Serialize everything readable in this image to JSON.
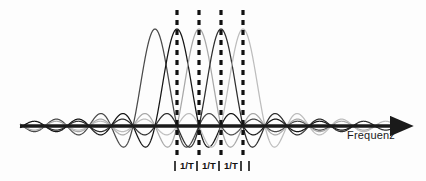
{
  "figure": {
    "background_color": "#fdfdfd"
  },
  "axis": {
    "label": "Frequenz",
    "label_color": "#1a1a1a",
    "line_color": "#1a1a1a",
    "baseline_y": 126,
    "x_start": 20,
    "x_end": 400,
    "arrowhead": "right-arrow-icon"
  },
  "markers": {
    "dashed_line_color": "#111111",
    "dashed_line_x": [
      177,
      199,
      221,
      243
    ],
    "dashed_line_top": 10,
    "dashed_line_bottom": 158,
    "tick_x": [
      175,
      197,
      219,
      241,
      249
    ],
    "spacing_labels": [
      {
        "text": "1/T",
        "x": 180
      },
      {
        "text": "1/T",
        "x": 202
      },
      {
        "text": "1/T",
        "x": 224
      }
    ]
  },
  "chart_data": {
    "type": "line",
    "xlabel": "Frequenz",
    "ylabel": "",
    "grid": false,
    "legend": false,
    "subcarrier_spacing_px": 22,
    "subcarrier_spacing_label": "1/T",
    "peak_amplitude_px": 97,
    "baseline_y_px": 126,
    "x_domain_px": [
      20,
      400
    ],
    "series": [
      {
        "name": "subcarrier-1",
        "center_x": 155,
        "color": "#4a4a4a",
        "peak_y": 29
      },
      {
        "name": "subcarrier-2",
        "center_x": 177,
        "color": "#151515",
        "peak_y": 29
      },
      {
        "name": "subcarrier-3",
        "center_x": 199,
        "color": "#a8a8a8",
        "peak_y": 29
      },
      {
        "name": "subcarrier-4",
        "center_x": 221,
        "color": "#2e2e2e",
        "peak_y": 29
      },
      {
        "name": "subcarrier-5",
        "center_x": 243,
        "color": "#bdbdbd",
        "peak_y": 29
      }
    ],
    "annotations": [
      {
        "text": "1/T",
        "x": 188,
        "y": 166
      },
      {
        "text": "1/T",
        "x": 210,
        "y": 166
      },
      {
        "text": "1/T",
        "x": 232,
        "y": 166
      },
      {
        "text": "Frequenz",
        "x": 347,
        "y": 135
      }
    ]
  }
}
